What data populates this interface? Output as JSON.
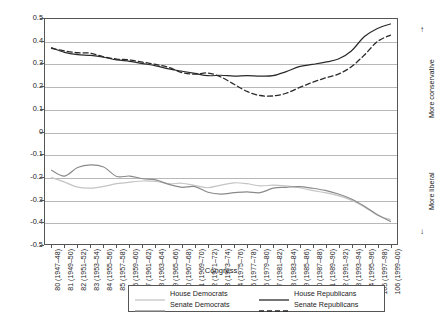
{
  "chart_data": {
    "type": "line",
    "title": "",
    "xlabel": "Congress",
    "ylabel": "Mean 1st dimension DW-Nominate score",
    "ylim": [
      -0.5,
      0.5
    ],
    "ytick_values": [
      0.5,
      0.4,
      0.3,
      0.2,
      0.1,
      0,
      -0.1,
      -0.2,
      -0.3,
      -0.4,
      -0.5
    ],
    "ytick_labels": [
      "0.5",
      "0.4",
      "0.3",
      "0.2",
      "0.1",
      "0",
      "-0.1",
      "-0.2",
      "-0.3",
      "-0.4",
      "-0.5"
    ],
    "grid": true,
    "grid_axis": "y",
    "legend_position": "below-center",
    "x": [
      80,
      81,
      82,
      83,
      84,
      85,
      86,
      87,
      88,
      89,
      90,
      91,
      92,
      93,
      94,
      95,
      96,
      97,
      98,
      99,
      100,
      101,
      102,
      103,
      104,
      105,
      106
    ],
    "categories": [
      "80 (1947–48)",
      "81 (1949–50)",
      "82 (1951–52)",
      "83 (1953–54)",
      "84 (1955–56)",
      "85 (1957–58)",
      "86 (1959–60)",
      "87 (1961–62)",
      "88 (1963–64)",
      "89 (1965–66)",
      "90 (1967–68)",
      "91 (1969–70)",
      "92 (1971–72)",
      "93 (1973–74)",
      "94 (1975–76)",
      "95 (1977–78)",
      "96 (1979–80)",
      "97 (1981–82)",
      "98 (1983–84)",
      "99 (1985–86)",
      "100 (1987–88)",
      "101 (1989–90)",
      "102 (1991–92)",
      "103 (1993–94)",
      "104 (1995–96)",
      "105 (1997–98)",
      "106 (1999–00)"
    ],
    "series": [
      {
        "name": "House Democrats",
        "color": "#c4c4c4",
        "style": "solid",
        "values": [
          -0.205,
          -0.225,
          -0.247,
          -0.252,
          -0.244,
          -0.232,
          -0.225,
          -0.22,
          -0.222,
          -0.232,
          -0.23,
          -0.24,
          -0.25,
          -0.238,
          -0.228,
          -0.232,
          -0.242,
          -0.238,
          -0.242,
          -0.25,
          -0.262,
          -0.272,
          -0.285,
          -0.305,
          -0.335,
          -0.372,
          -0.392
        ]
      },
      {
        "name": "Senate Democrats",
        "color": "#8a8a8a",
        "style": "solid",
        "values": [
          -0.172,
          -0.198,
          -0.16,
          -0.148,
          -0.158,
          -0.2,
          -0.198,
          -0.21,
          -0.215,
          -0.235,
          -0.248,
          -0.245,
          -0.27,
          -0.278,
          -0.272,
          -0.268,
          -0.272,
          -0.252,
          -0.248,
          -0.245,
          -0.252,
          -0.262,
          -0.278,
          -0.3,
          -0.332,
          -0.37,
          -0.4
        ]
      },
      {
        "name": "House Republicans",
        "color": "#2a2a2a",
        "style": "solid",
        "values": [
          0.372,
          0.352,
          0.342,
          0.338,
          0.33,
          0.318,
          0.312,
          0.302,
          0.292,
          0.278,
          0.268,
          0.258,
          0.248,
          0.25,
          0.246,
          0.248,
          0.246,
          0.248,
          0.266,
          0.288,
          0.298,
          0.308,
          0.322,
          0.358,
          0.422,
          0.458,
          0.478
        ]
      },
      {
        "name": "Senate Republicans",
        "color": "#2a2a2a",
        "style": "dashed",
        "values": [
          0.37,
          0.358,
          0.35,
          0.348,
          0.332,
          0.322,
          0.318,
          0.308,
          0.298,
          0.285,
          0.262,
          0.255,
          0.26,
          0.242,
          0.21,
          0.178,
          0.16,
          0.158,
          0.17,
          0.195,
          0.218,
          0.238,
          0.255,
          0.288,
          0.34,
          0.4,
          0.428
        ]
      }
    ],
    "annotations": [
      {
        "text": "More conservative",
        "arrow": "up",
        "position": "right-upper"
      },
      {
        "text": "More liberal",
        "arrow": "down",
        "position": "right-lower"
      }
    ],
    "arrow_glyphs": {
      "up": "↑",
      "down": "↓"
    }
  }
}
